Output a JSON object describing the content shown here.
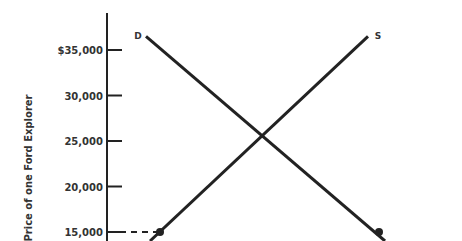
{
  "chart_data": {
    "type": "line",
    "title": "",
    "xlabel": "",
    "ylabel": "Price of one Ford Explorer",
    "ylim": [
      13000,
      38000
    ],
    "y_ticks": [
      {
        "value": 35000,
        "label": "$35,000"
      },
      {
        "value": 30000,
        "label": "30,000"
      },
      {
        "value": 25000,
        "label": "25,000"
      },
      {
        "value": 20000,
        "label": "20,000"
      },
      {
        "value": 15000,
        "label": "15,000"
      }
    ],
    "series": [
      {
        "name": "D",
        "label": "D",
        "kind": "demand",
        "points": [
          {
            "x": 0.12,
            "y": 36500
          },
          {
            "x": 0.85,
            "y": 13000
          }
        ]
      },
      {
        "name": "S",
        "label": "S",
        "kind": "supply",
        "points": [
          {
            "x": 0.13,
            "y": 13000
          },
          {
            "x": 0.8,
            "y": 36500
          }
        ]
      }
    ],
    "markers": [
      {
        "series": "S",
        "x": 0.17,
        "y": 15000
      },
      {
        "series": "D",
        "x": 0.83,
        "y": 15000
      }
    ],
    "reference_lines": [
      {
        "type": "horizontal-dashed",
        "y": 15000,
        "to_series": "S"
      }
    ],
    "equilibrium": {
      "price": 25000
    },
    "grid": false,
    "legend": "none"
  }
}
